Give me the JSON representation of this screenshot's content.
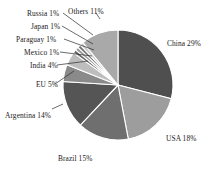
{
  "chart_data": {
    "type": "pie",
    "title": "",
    "subtitle": "",
    "xlabel": "",
    "ylabel": "",
    "legend_position": "none",
    "grid": false,
    "units": "percent",
    "start_angle_deg": 0,
    "direction": "clockwise",
    "categories": [
      "China",
      "USA",
      "Brazil",
      "Argentina",
      "EU",
      "India",
      "Mexico",
      "Paraguay",
      "Japan",
      "Russia",
      "Others"
    ],
    "values": [
      29,
      18,
      15,
      14,
      5,
      4,
      1,
      1,
      1,
      1,
      11
    ],
    "labels": [
      "China 29%",
      "USA 18%",
      "Brazil 15%",
      "Argentina 14%",
      "EU 5%",
      "India 4%",
      "Mexico 1%",
      "Paraguay 1%",
      "Japan 1%",
      "Russia 1%",
      "Others 11%"
    ],
    "colors": [
      "#4f4f4f",
      "#9d9d9d",
      "#6f6f6f",
      "#555555",
      "#8a8a8a",
      "#bdbdbd",
      "#6a6a6a",
      "#9a9a9a",
      "#787878",
      "#c8c8c8",
      "#a9a9a9"
    ]
  },
  "geometry": {
    "cx": 118,
    "cy": 85,
    "r": 55
  },
  "labels_layout": [
    {
      "key": "others",
      "text": "Others 11%",
      "x": 68,
      "y": 8,
      "anchor": "start"
    },
    {
      "key": "russia",
      "text": "Russia 1%",
      "x": 27,
      "y": 10,
      "anchor": "start"
    },
    {
      "key": "japan",
      "text": "Japan 1%",
      "x": 31,
      "y": 23,
      "anchor": "start"
    },
    {
      "key": "paraguay",
      "text": "Paraguay 1%",
      "x": 16,
      "y": 36,
      "anchor": "start"
    },
    {
      "key": "mexico",
      "text": "Mexico 1%",
      "x": 24,
      "y": 49,
      "anchor": "start"
    },
    {
      "key": "india",
      "text": "India 4%",
      "x": 30,
      "y": 62,
      "anchor": "start"
    },
    {
      "key": "eu",
      "text": "EU 5%",
      "x": 36,
      "y": 81,
      "anchor": "start"
    },
    {
      "key": "argentina",
      "text": "Argentina 14%",
      "x": 5,
      "y": 112,
      "anchor": "start"
    },
    {
      "key": "brazil",
      "text": "Brazil 15%",
      "x": 58,
      "y": 155,
      "anchor": "start"
    },
    {
      "key": "usa",
      "text": "USA 18%",
      "x": 166,
      "y": 135,
      "anchor": "start"
    },
    {
      "key": "china",
      "text": "China 29%",
      "x": 167,
      "y": 40,
      "anchor": "start"
    }
  ],
  "leader_lines": [
    {
      "key": "others-leader",
      "d": "M 96 13 L 100 19"
    },
    {
      "key": "russia-leader",
      "d": "M 63 13 L 93 35"
    },
    {
      "key": "japan-leader",
      "d": "M 62 26 L 93 44"
    },
    {
      "key": "paraguay-leader",
      "d": "M 64 39 L 94 50"
    },
    {
      "key": "mexico-leader",
      "d": "M 60 52 L 92 56"
    },
    {
      "key": "india-leader",
      "d": "M 57 65 L 88 61"
    },
    {
      "key": "eu-leader",
      "d": "M 55 84 L 74 71"
    },
    {
      "key": "argentina-leader",
      "d": "M 52 109 L 63 104"
    }
  ]
}
